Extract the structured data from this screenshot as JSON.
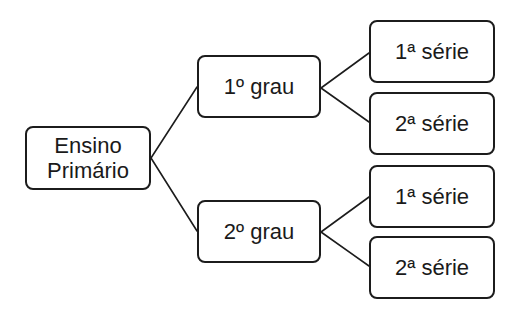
{
  "diagram": {
    "type": "tree",
    "root": {
      "label": "Ensino\nPrimário"
    },
    "branches": [
      {
        "label": "1º grau",
        "children": [
          {
            "label": "1ª série"
          },
          {
            "label": "2ª série"
          }
        ]
      },
      {
        "label": "2º grau",
        "children": [
          {
            "label": "1ª série"
          },
          {
            "label": "2ª série"
          }
        ]
      }
    ],
    "colors": {
      "stroke": "#1c1c1c",
      "fill": "#ffffff",
      "text": "#1a1a1a"
    }
  }
}
